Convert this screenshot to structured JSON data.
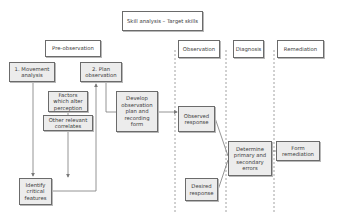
{
  "diagram": {
    "title": "Skill analysis – Target skills",
    "phases": {
      "pre_observation": "Pre-observation",
      "observation": "Observation",
      "diagnosis": "Diagnosis",
      "remediation": "Remediation"
    },
    "nodes": {
      "movement_analysis": "1. Movement\nanalysis",
      "plan_observation": "2. Plan\nobservation",
      "factors": "Factors\nwhich alter\nperception",
      "other_correlates": "Other relevant\ncorrelates",
      "develop_plan": "Develop\nobservation\nplan and\nrecording\nform",
      "identify_features": "Identify\ncritical\nfeatures",
      "observed_response": "Observed\nresponse",
      "desired_response": "Desired\nresponse",
      "determine_errors": "Determine\nprimary and\nsecondary\nerrors",
      "form_remediation": "Form\nremediation"
    },
    "edges": [
      {
        "from": "movement_analysis",
        "to": "identify_features"
      },
      {
        "from": "other_correlates",
        "to": "identify_features"
      },
      {
        "from": "identify_features",
        "to": "plan_observation"
      },
      {
        "from": "plan_observation",
        "to": "develop_plan"
      },
      {
        "from": "develop_plan",
        "to": "observed_response"
      },
      {
        "from": "observed_response",
        "to": "determine_errors"
      },
      {
        "from": "desired_response",
        "to": "determine_errors"
      },
      {
        "from": "determine_errors",
        "to": "form_remediation"
      }
    ],
    "colors": {
      "box_fill": "#ececec",
      "box_border": "#6b6b6b",
      "line": "#7a7a7a"
    }
  }
}
